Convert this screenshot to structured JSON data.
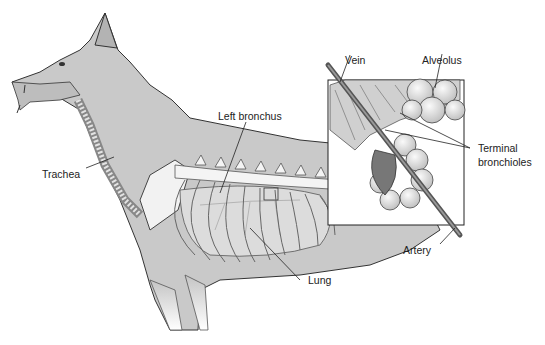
{
  "figure": {
    "labels": {
      "trachea": "Trachea",
      "left_bronchus": "Left bronchus",
      "lung": "Lung",
      "vein": "Vein",
      "alveolus": "Alveolus",
      "terminal_bronchioles_line1": "Terminal",
      "terminal_bronchioles_line2": "bronchioles",
      "artery": "Artery"
    },
    "colors": {
      "body_fill": "#c9c9c9",
      "body_shade": "#a9a9a9",
      "outline": "#333333",
      "bone": "#f4f4f4",
      "lung": "#d8d8d8",
      "inset_bg": "#ffffff",
      "alveolus": "#ececec"
    }
  }
}
